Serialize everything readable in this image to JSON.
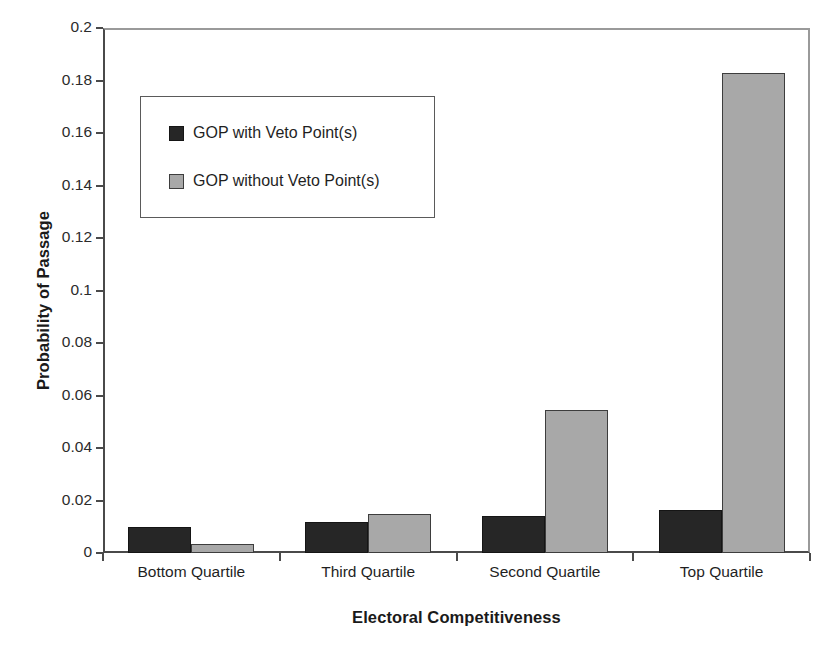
{
  "chart_data": {
    "type": "bar",
    "title": "",
    "xlabel": "Electoral Competitiveness",
    "ylabel": "Probability of Passage",
    "categories": [
      "Bottom Quartile",
      "Third Quartile",
      "Second Quartile",
      "Top Quartile"
    ],
    "series": [
      {
        "name": "GOP with Veto Point(s)",
        "color": "#262626",
        "values": [
          0.01,
          0.0118,
          0.0141,
          0.0164
        ]
      },
      {
        "name": "GOP without Veto Point(s)",
        "color": "#a8a8a8",
        "values": [
          0.0034,
          0.0149,
          0.0545,
          0.1829
        ]
      }
    ],
    "ylim": [
      0,
      0.2
    ],
    "ytick_values": [
      0,
      0.02,
      0.04,
      0.06,
      0.08,
      0.1,
      0.12,
      0.14,
      0.16,
      0.18,
      0.2
    ],
    "ytick_labels": [
      "0",
      "0.02",
      "0.04",
      "0.06",
      "0.08",
      "0.1",
      "0.12",
      "0.14",
      "0.16",
      "0.18",
      "0.2"
    ],
    "grid": false,
    "legend_position": "upper-left-inset"
  },
  "legend": {
    "entries": [
      {
        "label": "GOP with Veto Point(s)",
        "swatch": "dark"
      },
      {
        "label": "GOP without Veto Point(s)",
        "swatch": "gray"
      }
    ]
  },
  "axes": {
    "y_title": "Probability of Passage",
    "x_title": "Electoral Competitiveness"
  }
}
